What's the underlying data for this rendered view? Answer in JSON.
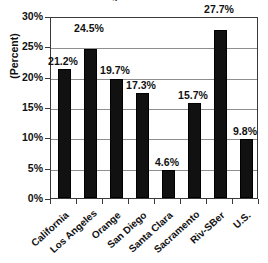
{
  "chart_data": {
    "type": "bar",
    "title": "Regional Rates",
    "xlabel": "",
    "ylabel": "(Percent)",
    "categories": [
      "California",
      "Los Angeles",
      "Orange",
      "San Diego",
      "Santa Clara",
      "Sacramento",
      "Riv-SBer",
      "U.S."
    ],
    "values": [
      21.2,
      24.5,
      19.7,
      17.3,
      4.6,
      15.7,
      27.7,
      9.8
    ],
    "value_labels": [
      "21.2%",
      "24.5%",
      "19.7%",
      "17.3%",
      "4.6%",
      "15.7%",
      "27.7%",
      "9.8%"
    ],
    "ylim": [
      0,
      30
    ],
    "ytick_values": [
      0,
      5,
      10,
      15,
      20,
      25,
      30
    ],
    "ytick_labels": [
      "0%",
      "5%",
      "10%",
      "15%",
      "20%",
      "25%",
      "30%"
    ],
    "grid": true,
    "legend": "none",
    "bar_color": "#111111",
    "axis_color": "#3a3a3a",
    "grid_color": "#8e8e8e"
  }
}
